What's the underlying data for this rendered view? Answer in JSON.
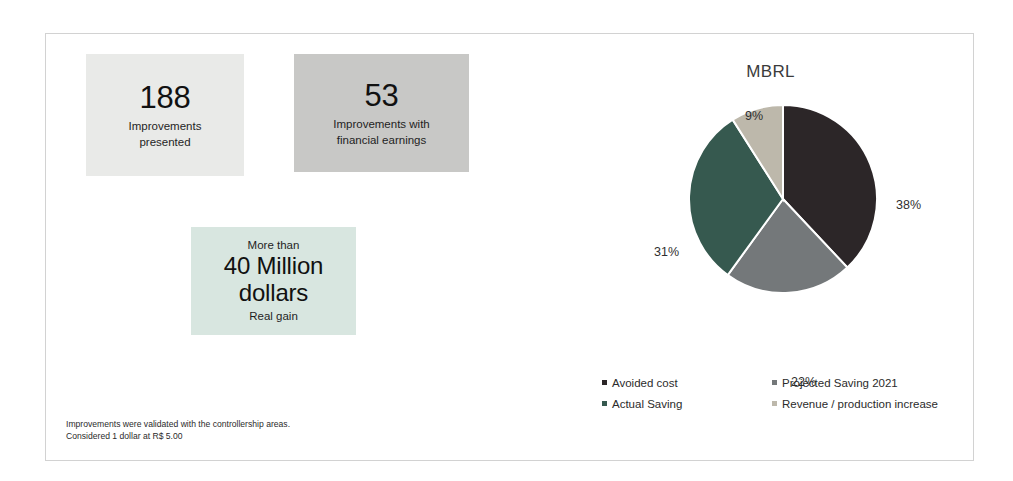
{
  "slide": {
    "footnote": "Improvements were validated with the controllership areas.\nConsidered 1 dollar at R$ 5.00"
  },
  "kpis": [
    {
      "name": "improvements-presented",
      "number": "188",
      "caption": "Improvements\npresented",
      "background": "#e9eae8"
    },
    {
      "name": "improvements-with-financial-earnings",
      "number": "53",
      "caption": "Improvements with\nfinancial earnings",
      "background": "#c8c8c6"
    },
    {
      "name": "real-gain",
      "top_text": "More than",
      "number": "40 Million\ndollars",
      "caption": "Real gain",
      "background": "#d8e6e0"
    }
  ],
  "chart_data": {
    "type": "pie",
    "title": "MBRL",
    "categories": [
      "Avoided cost",
      "Projected Saving 2021",
      "Actual Saving",
      "Revenue / production increase"
    ],
    "values": [
      38,
      22,
      31,
      9
    ],
    "value_labels": [
      "38%",
      "22%",
      "31%",
      "9%"
    ],
    "colors": [
      "#2c2628",
      "#74787a",
      "#36594f",
      "#bdb8ab"
    ],
    "legend_position": "bottom",
    "legend_columns": 2,
    "legend_order": [
      "Avoided cost",
      "Projected Saving 2021",
      "Actual Saving",
      "Revenue / production increase"
    ],
    "start_angle_deg": 0,
    "direction": "clockwise",
    "xlabel": "",
    "ylabel": ""
  }
}
